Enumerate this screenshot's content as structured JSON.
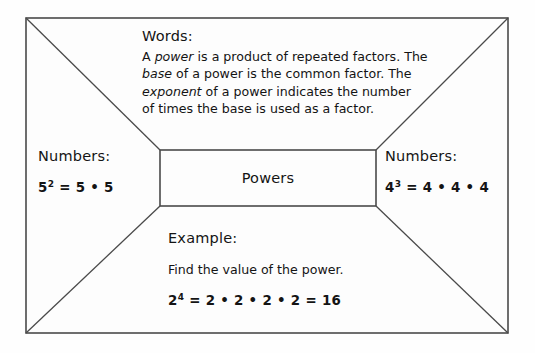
{
  "organizer": {
    "type": "four-square-graphic-organizer",
    "center": {
      "label": "Powers"
    },
    "sections": {
      "words": {
        "heading": "Words:",
        "lines": [
          {
            "parts": [
              {
                "text": "A ",
                "italic": false
              },
              {
                "text": "power",
                "italic": true
              },
              {
                "text": " is a product of repeated factors. The",
                "italic": false
              }
            ]
          },
          {
            "parts": [
              {
                "text": "base",
                "italic": true
              },
              {
                "text": " of a power is the common factor. The",
                "italic": false
              }
            ]
          },
          {
            "parts": [
              {
                "text": "exponent",
                "italic": true
              },
              {
                "text": " of a power indicates the number",
                "italic": false
              }
            ]
          },
          {
            "parts": [
              {
                "text": "of times the base is used as a factor.",
                "italic": false
              }
            ]
          }
        ]
      },
      "numbers_left": {
        "heading": "Numbers:",
        "expression": {
          "base": "5",
          "exponent": "2",
          "expansion": "= 5 • 5"
        }
      },
      "numbers_right": {
        "heading": "Numbers:",
        "expression": {
          "base": "4",
          "exponent": "3",
          "expansion": "= 4 • 4 • 4"
        }
      },
      "example": {
        "heading": "Example:",
        "prompt": "Find the value of the power.",
        "work": {
          "base": "2",
          "exponent": "4",
          "expansion": "= 2 • 2 • 2 • 2 = 16"
        }
      }
    }
  },
  "colors": {
    "ink": "#141414",
    "line": "#4a4a4a",
    "paper": "#fefefe"
  }
}
